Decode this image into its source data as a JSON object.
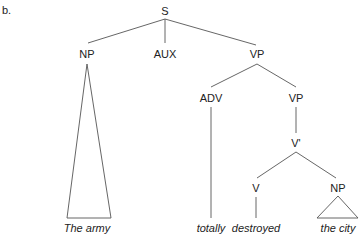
{
  "figure_label": "b.",
  "tree": {
    "nodes": {
      "s": "S",
      "np": "NP",
      "aux": "AUX",
      "vp": "VP",
      "adv": "ADV",
      "vp2": "VP",
      "vbar": "V'",
      "v": "V",
      "np2": "NP"
    },
    "leaves": {
      "np": "The army",
      "adv": "totally",
      "v": "destroyed",
      "np2": "the city"
    }
  }
}
